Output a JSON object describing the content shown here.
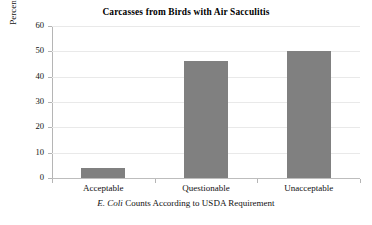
{
  "chart_data": {
    "type": "bar",
    "title": "Carcasses from Birds with Air Sacculitis",
    "xlabel_italic": "E. Coli",
    "xlabel_rest": " Counts According to USDA Requirement",
    "xlabel": "E. Coli Counts According to USDA Requirement",
    "ylabel": "Percentage of Carcasses in Range",
    "categories": [
      "Acceptable",
      "Questionable",
      "Unacceptable"
    ],
    "values": [
      4,
      46,
      50
    ],
    "series": [
      {
        "name": "Percentage of Carcasses in Range",
        "values": [
          4,
          46,
          50
        ]
      }
    ],
    "ylim": [
      0,
      60
    ],
    "ytick_labels": [
      "0",
      "10",
      "20",
      "30",
      "40",
      "50",
      "60"
    ],
    "ytick_values": [
      0,
      10,
      20,
      30,
      40,
      50,
      60
    ],
    "grid": true,
    "grid_axis": "y",
    "legend": false,
    "legend_position": "none",
    "bar_color": "#808080",
    "grid_color": "#e9e9e9",
    "axis_color": "#b5b5b5",
    "background_color": "#ffffff",
    "text_color": "#111111"
  }
}
